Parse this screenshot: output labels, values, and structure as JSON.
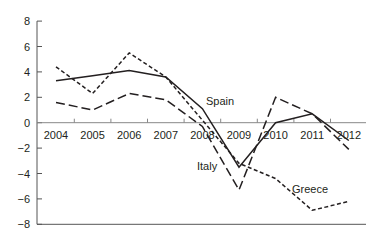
{
  "chart_data": {
    "type": "line",
    "title": "",
    "xlabel": "",
    "ylabel": "",
    "categories": [
      "2004",
      "2005",
      "2006",
      "2007",
      "2008",
      "2009",
      "2010",
      "2011",
      "2012"
    ],
    "ylim": [
      -8,
      8
    ],
    "yticks": [
      8,
      6,
      4,
      2,
      0,
      -2,
      -4,
      -6,
      -8
    ],
    "ytick_labels": [
      "8",
      "6",
      "4",
      "2",
      "0",
      "−2",
      "−4",
      "−6",
      "−8"
    ],
    "grid": false,
    "legend": "inline labels",
    "series": [
      {
        "name": "Spain",
        "style": "solid",
        "values": [
          3.3,
          3.7,
          4.1,
          3.6,
          1.1,
          -3.5,
          0.0,
          0.7,
          -1.4
        ]
      },
      {
        "name": "Greece",
        "style": "short-dash",
        "values": [
          4.4,
          2.3,
          5.5,
          3.6,
          0.2,
          -3.2,
          -4.4,
          -6.9,
          -6.2
        ]
      },
      {
        "name": "Italy",
        "style": "long-dash",
        "values": [
          1.6,
          1.0,
          2.3,
          1.8,
          -0.3,
          -5.3,
          2.0,
          0.7,
          -2.1
        ]
      }
    ],
    "annotations": [
      {
        "text": "Spain",
        "x": 206,
        "y": 105
      },
      {
        "text": "Italy",
        "x": 197,
        "y": 170
      },
      {
        "text": "Greece",
        "x": 292,
        "y": 193
      }
    ],
    "line_color": "#231f20"
  }
}
